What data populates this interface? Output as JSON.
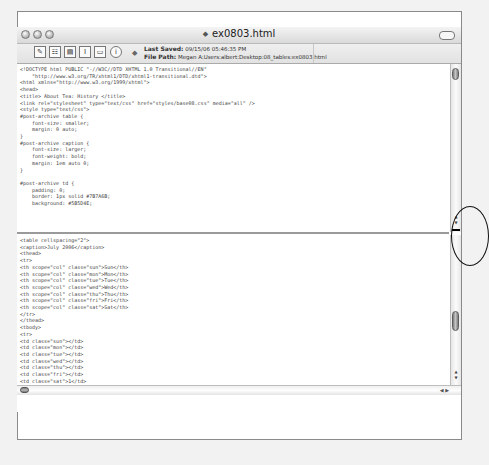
{
  "window": {
    "title": "ex0803.html",
    "doc_icon": "◆"
  },
  "toolbar": {
    "buttons": [
      {
        "name": "edit-icon",
        "glyph": "✎"
      },
      {
        "name": "list-icon",
        "glyph": "☷"
      },
      {
        "name": "document-icon",
        "glyph": "▤"
      },
      {
        "name": "text-cursor-icon",
        "glyph": "I"
      },
      {
        "name": "comment-icon",
        "glyph": "▭"
      },
      {
        "name": "info-icon",
        "glyph": "i"
      }
    ],
    "status_dot": "◆",
    "last_saved_label": "Last Saved:",
    "last_saved_value": "09/15/06 05:46:35 PM",
    "file_path_label": "File Path:",
    "file_path_value": "Megan A:Users:albert:Desktop:08_tables:ex0803.html"
  },
  "editor": {
    "top_pane_code": "<!DOCTYPE html PUBLIC \"-//W3C//DTD XHTML 1.0 Transitional//EN\"\n    \"http://www.w3.org/TR/xhtml1/DTD/xhtml1-transitional.dtd\">\n<html xmlns=\"http://www.w3.org/1999/xhtml\">\n<head>\n<title> About Tea: History </title>\n<link rel=\"stylesheet\" type=\"text/css\" href=\"styles/base08.css\" media=\"all\" />\n<style type=\"text/css\">\n#post-archive table {\n    font-size: smaller;\n    margin: 0 auto;\n}\n#post-archive caption {\n    font-size: larger;\n    font-weight: bold;\n    margin: 1em auto 0;\n}\n\n#post-archive td {\n    padding: 0;\n    border: 1px solid #7B7A6B;\n    background: #5B5D4E;",
    "bottom_pane_code": "<table cellspacing=\"2\">\n<caption>July 2006</caption>\n<thead>\n<tr>\n<th scope=\"col\" class=\"sun\">Sun</th>\n<th scope=\"col\" class=\"mon\">Mon</th>\n<th scope=\"col\" class=\"tue\">Tue</th>\n<th scope=\"col\" class=\"wed\">Wed</th>\n<th scope=\"col\" class=\"thu\">Thu</th>\n<th scope=\"col\" class=\"fri\">Fri</th>\n<th scope=\"col\" class=\"sat\">Sat</th>\n</tr>\n</thead>\n<tbody>\n<tr>\n<td class=\"sun\"></td>\n<td class=\"mon\"></td>\n<td class=\"tue\"></td>\n<td class=\"wed\"></td>\n<td class=\"thu\"></td>\n<td class=\"fri\"></td>\n<td class=\"sat\">1</td>\n</tr>\n<tr>\n<td class=\"sun\">2</td>\n<td class=\"mon\">3</td>\n<td class=\"tue\">4</td>"
  },
  "scroll": {
    "up_arrow": "▲",
    "down_arrow": "▼",
    "left_arrow": "◀",
    "right_arrow": "▶"
  }
}
